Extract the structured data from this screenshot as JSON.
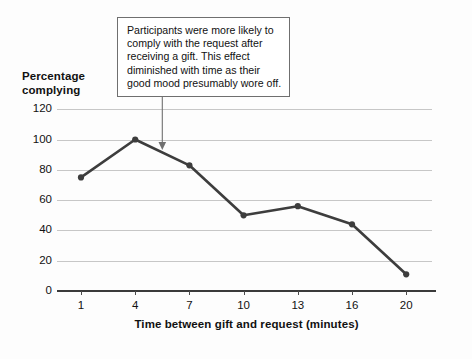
{
  "chart_data": {
    "type": "line",
    "title": "",
    "xlabel": "Time between gift and request (minutes)",
    "ylabel": "Percentage complying",
    "categories": [
      "1",
      "4",
      "7",
      "10",
      "13",
      "16",
      "20"
    ],
    "x": [
      1,
      4,
      7,
      10,
      13,
      16,
      20
    ],
    "values": [
      75,
      100,
      83,
      50,
      56,
      44,
      11
    ],
    "series": [
      {
        "name": "Percentage complying",
        "values": [
          75,
          100,
          83,
          50,
          56,
          44,
          11
        ]
      }
    ],
    "ylim": [
      0,
      120
    ],
    "yticks": [
      0,
      20,
      40,
      60,
      80,
      100,
      120
    ],
    "ytick_labels": [
      "0",
      "20",
      "40",
      "60",
      "80",
      "100",
      "120"
    ],
    "xticks": [
      1,
      4,
      7,
      10,
      13,
      16,
      20
    ],
    "xtick_labels": [
      "1",
      "4",
      "7",
      "10",
      "13",
      "16",
      "20"
    ],
    "grid": "horizontal",
    "legend": "none",
    "line_color": "#3d3d3d",
    "marker_color": "#3d3d3d",
    "gridline_color": "#c7c7c7",
    "axis_color": "#3a3a3a",
    "background_color": "#fdfdfd",
    "annotations": [
      {
        "text": "Participants were more likely to comply with the request after receiving a gift. This effect diminished with time as their good mood presumably wore off.",
        "lines": [
          "Participants were more likely to",
          "comply with the request after",
          "receiving a gift. This effect",
          "diminished with time as their",
          "good mood presumably wore off."
        ],
        "points_to_x": 5.5,
        "points_to_y": 93,
        "border_color": "#6f6f6f",
        "background_color": "#ffffff"
      }
    ]
  },
  "axis_title": {
    "y_line1": "Percentage",
    "y_line2": "complying",
    "x": "Time between gift and request (minutes)"
  }
}
